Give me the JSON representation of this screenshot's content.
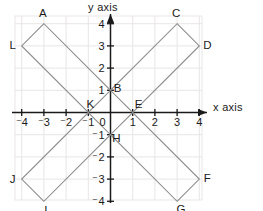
{
  "figure": {
    "name": "coordinate-plane-two-overlapping-rectangles",
    "x_axis_label": "x axis",
    "y_axis_label": "y axis"
  },
  "chart_data": {
    "type": "scatter",
    "title": "",
    "xlabel": "x axis",
    "ylabel": "y axis",
    "xlim": [
      -4.8,
      4.8
    ],
    "ylim": [
      -4.8,
      4.8
    ],
    "xticks": [
      -4,
      -3,
      -2,
      -1,
      0,
      1,
      2,
      3,
      4
    ],
    "yticks": [
      -4,
      -3,
      -2,
      -1,
      0,
      1,
      2,
      3,
      4
    ],
    "xtick_labels": [
      "⁻4",
      "⁻3",
      "⁻2",
      "⁻1",
      "0",
      "1",
      "2",
      "3",
      "4"
    ],
    "ytick_labels": [
      "⁻4",
      "⁻3",
      "⁻2",
      "⁻1",
      "0",
      "1",
      "2",
      "3",
      "4"
    ],
    "grid": true,
    "grid_color": "#e9e5e5",
    "axis_color": "#1a1a1a",
    "shape_color": "#8d8d8d",
    "legend": "none",
    "points": [
      {
        "label": "A",
        "x": -3,
        "y": 4
      },
      {
        "label": "B",
        "x": 0,
        "y": 1
      },
      {
        "label": "C",
        "x": 3,
        "y": 4
      },
      {
        "label": "D",
        "x": 4,
        "y": 3
      },
      {
        "label": "E",
        "x": 1,
        "y": 0
      },
      {
        "label": "F",
        "x": 4,
        "y": -3
      },
      {
        "label": "G",
        "x": 3,
        "y": -4
      },
      {
        "label": "H",
        "x": 0,
        "y": -1
      },
      {
        "label": "I",
        "x": -3,
        "y": -4
      },
      {
        "label": "J",
        "x": -4,
        "y": -3
      },
      {
        "label": "K",
        "x": -1,
        "y": 0
      },
      {
        "label": "L",
        "x": -4,
        "y": 3
      }
    ],
    "shapes": [
      {
        "name": "rectangle-A-L-K-B",
        "type": "polygon",
        "vertices": [
          "A",
          "L",
          "K",
          "B"
        ]
      },
      {
        "name": "rectangle-C-D-E-B",
        "type": "polygon",
        "vertices": [
          "C",
          "D",
          "E",
          "B"
        ]
      },
      {
        "name": "rectangle-I-J-K-H",
        "type": "polygon",
        "vertices": [
          "I",
          "J",
          "K",
          "H"
        ]
      },
      {
        "name": "rectangle-G-F-E-H",
        "type": "polygon",
        "vertices": [
          "G",
          "F",
          "E",
          "H"
        ]
      }
    ]
  }
}
